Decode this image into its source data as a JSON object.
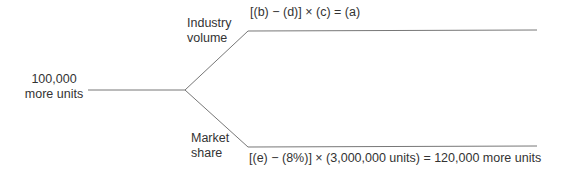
{
  "root": {
    "line1": "100,000",
    "line2": "more units"
  },
  "upper": {
    "label1": "Industry",
    "label2": "volume",
    "formula": "[(b) − (d)] × (c) = (a)"
  },
  "lower": {
    "label1": "Market",
    "label2": "share",
    "formula": "[(e) − (8%)] × (3,000,000 units) = 120,000 more units"
  },
  "colors": {
    "line": "#777777",
    "text": "#333333"
  }
}
